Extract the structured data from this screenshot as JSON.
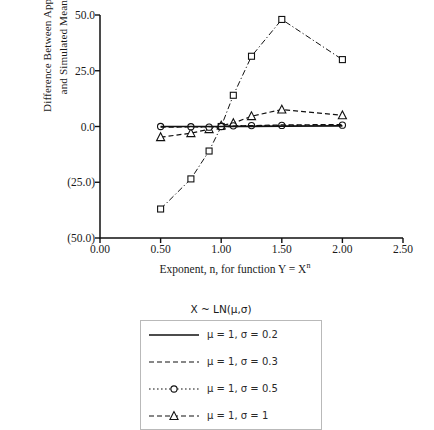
{
  "figure": {
    "y_axis_title": "Difference Between Approximate\nand Simulated Means (%)",
    "x_axis_title_prefix": "Exponent, n, for function Y = X",
    "x_axis_title_sup": "n",
    "legend_title": "X ~ LN(μ,σ)"
  },
  "legend": {
    "entries": [
      {
        "label": "μ = 1, σ = 0.2",
        "style": "solid",
        "marker": "none"
      },
      {
        "label": "μ = 1, σ = 0.3",
        "style": "dashed",
        "marker": "none"
      },
      {
        "label": "μ = 1, σ = 0.5",
        "style": "dotted",
        "marker": "circle"
      },
      {
        "label": "μ = 1, σ = 1",
        "style": "dashed",
        "marker": "triangle"
      }
    ]
  },
  "chart_data": {
    "type": "line",
    "title": "",
    "xlabel": "Exponent, n, for function Y = X^n",
    "ylabel": "Difference Between Approximate and Simulated Means (%)",
    "xlim": [
      0.0,
      2.5
    ],
    "ylim": [
      -50.0,
      50.0
    ],
    "xticks": [
      0.0,
      0.5,
      1.0,
      1.5,
      2.0,
      2.5
    ],
    "xtick_labels": [
      "0.00",
      "0.50",
      "1.00",
      "1.50",
      "2.00",
      "2.50"
    ],
    "yticks": [
      -50.0,
      -25.0,
      0.0,
      25.0,
      50.0
    ],
    "ytick_labels": [
      "(50.0)",
      "(25.0)",
      "0.0",
      "25.0",
      "50.0"
    ],
    "grid": false,
    "legend_position": "below-plot",
    "legend_title": "X ~ LN(μ,σ)",
    "series": [
      {
        "name": "μ = 1, σ = 0.2",
        "style": "solid",
        "marker": "none",
        "x": [
          0.5,
          0.75,
          0.9,
          1.0,
          1.1,
          1.25,
          1.5,
          2.0
        ],
        "values": [
          0.0,
          0.0,
          0.0,
          0.0,
          0.1,
          0.1,
          0.2,
          0.3
        ]
      },
      {
        "name": "μ = 1, σ = 0.3",
        "style": "dashed",
        "marker": "none",
        "x": [
          0.5,
          0.75,
          0.9,
          1.0,
          1.1,
          1.25,
          1.5,
          2.0
        ],
        "values": [
          -0.3,
          -0.2,
          -0.1,
          0.0,
          0.2,
          0.4,
          0.7,
          0.9
        ]
      },
      {
        "name": "μ = 1, σ = 0.5",
        "style": "dotted",
        "marker": "circle",
        "x": [
          0.5,
          0.75,
          0.9,
          1.0,
          1.1,
          1.25,
          1.5,
          2.0
        ],
        "values": [
          0.0,
          -0.1,
          -0.3,
          0.0,
          0.3,
          0.4,
          0.5,
          0.6
        ]
      },
      {
        "name": "μ = 1, σ = 1",
        "style": "dashed",
        "marker": "triangle",
        "x": [
          0.5,
          0.75,
          0.9,
          1.0,
          1.1,
          1.25,
          1.5,
          2.0
        ],
        "values": [
          -4.8,
          -3.0,
          -1.2,
          0.4,
          1.5,
          4.6,
          7.6,
          5.0
        ]
      },
      {
        "name": "dash-dot square series",
        "style": "dashdot",
        "marker": "square",
        "x": [
          0.5,
          0.75,
          0.9,
          1.0,
          1.1,
          1.25,
          1.5,
          2.0
        ],
        "values": [
          -37.0,
          -23.5,
          -11.0,
          0.0,
          14.0,
          31.5,
          48.0,
          30.0
        ]
      }
    ]
  }
}
